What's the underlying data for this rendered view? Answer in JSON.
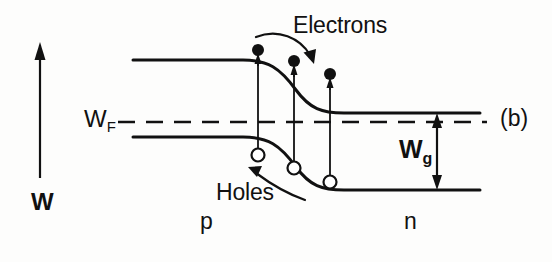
{
  "figure": {
    "panel_label": "(b)",
    "type": "energy-band-diagram"
  },
  "axis": {
    "vertical_label": "W",
    "arrow_direction": "up"
  },
  "labels": {
    "electrons": "Electrons",
    "holes": "Holes",
    "fermi_level": "W",
    "fermi_level_sub": "F",
    "band_gap": "W",
    "band_gap_sub": "g",
    "region_left": "p",
    "region_right": "n"
  },
  "colors": {
    "ink": "#111111",
    "background": "#fdfdfc"
  },
  "carriers": {
    "electrons": {
      "symbol": "filled-circle",
      "count": 3,
      "positions": [
        {
          "x": 258,
          "y": 57
        },
        {
          "x": 294,
          "y": 68
        },
        {
          "x": 330,
          "y": 81
        }
      ]
    },
    "holes": {
      "symbol": "open-circle",
      "count": 3,
      "positions": [
        {
          "x": 258,
          "y": 150
        },
        {
          "x": 294,
          "y": 162
        },
        {
          "x": 330,
          "y": 176
        }
      ]
    }
  },
  "bands": {
    "conduction": {
      "left_level_y": 60,
      "right_level_y": 113,
      "x_start": 133,
      "x_end": 480
    },
    "valence": {
      "left_level_y": 137,
      "right_level_y": 190,
      "x_start": 133,
      "x_end": 480
    },
    "fermi": {
      "y": 122,
      "x_start": 118,
      "x_end": 487,
      "style": "dashed"
    }
  }
}
